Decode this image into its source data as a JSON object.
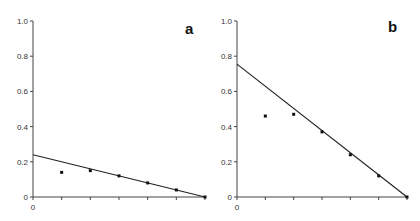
{
  "chart_data": [
    {
      "type": "scatter",
      "panel_label": "a",
      "title": "",
      "xlabel": "",
      "ylabel": "",
      "ylim": [
        0,
        1.0
      ],
      "xlim": [
        0,
        6
      ],
      "yticks": [
        "0",
        "0.2",
        "0.4",
        "0.6",
        "0.8",
        "1.0"
      ],
      "xticks": [
        "0",
        "",
        "",
        "",
        "",
        "",
        ""
      ],
      "grid": false,
      "points": [
        {
          "x": 1,
          "y": 0.14
        },
        {
          "x": 2,
          "y": 0.15
        },
        {
          "x": 3,
          "y": 0.12
        },
        {
          "x": 4,
          "y": 0.08
        },
        {
          "x": 5,
          "y": 0.04
        },
        {
          "x": 6,
          "y": 0.0
        }
      ],
      "fit_line": {
        "x0": 0,
        "y0": 0.24,
        "x1": 6,
        "y1": 0.0
      }
    },
    {
      "type": "scatter",
      "panel_label": "b",
      "title": "",
      "xlabel": "",
      "ylabel": "",
      "ylim": [
        0,
        1.0
      ],
      "xlim": [
        0,
        6
      ],
      "yticks": [
        "0",
        "0.2",
        "0.4",
        "0.6",
        "0.8",
        "1.0"
      ],
      "xticks": [
        "0",
        "",
        "",
        "",
        "",
        "",
        ""
      ],
      "grid": false,
      "points": [
        {
          "x": 1,
          "y": 0.46
        },
        {
          "x": 2,
          "y": 0.47
        },
        {
          "x": 3,
          "y": 0.37
        },
        {
          "x": 4,
          "y": 0.24
        },
        {
          "x": 5,
          "y": 0.12
        },
        {
          "x": 6,
          "y": 0.0
        }
      ],
      "fit_line": {
        "x0": 0,
        "y0": 0.755,
        "x1": 6,
        "y1": 0.0
      }
    }
  ],
  "layout": {
    "panels": [
      {
        "x0": 33,
        "x1": 205,
        "y0": 197,
        "y1": 21,
        "label_x": 185,
        "label_y": 34
      },
      {
        "x0": 237,
        "x1": 407,
        "y0": 197,
        "y1": 21,
        "label_x": 388,
        "label_y": 32
      }
    ],
    "colors": {
      "axis": "#444444",
      "line": "#222222",
      "point": "#111111"
    }
  }
}
